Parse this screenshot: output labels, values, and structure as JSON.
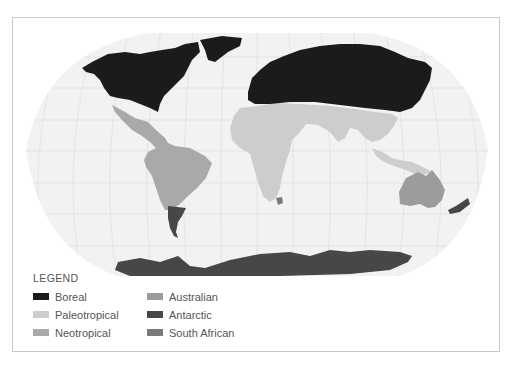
{
  "map": {
    "projection": "Robinson",
    "background_color": "#f2f2f2",
    "graticule_color": "#dedede",
    "regions": [
      {
        "name": "Boreal",
        "color": "#1b1b1b",
        "areas": [
          "North America (north of Mexico)",
          "Greenland",
          "Europe",
          "North Africa coast",
          "Northern Asia"
        ]
      },
      {
        "name": "Paleotropical",
        "color": "#cdcdcd",
        "areas": [
          "Africa",
          "Middle East",
          "South Asia",
          "Southeast Asia",
          "New Guinea"
        ]
      },
      {
        "name": "Neotropical",
        "color": "#a9a9a9",
        "areas": [
          "Mexico",
          "Central America",
          "South America"
        ]
      },
      {
        "name": "Australian",
        "color": "#9c9c9c",
        "areas": [
          "Australia"
        ]
      },
      {
        "name": "Antarctic",
        "color": "#474747",
        "areas": [
          "Antarctica",
          "Patagonia",
          "New Zealand"
        ]
      },
      {
        "name": "South African",
        "color": "#7a7a7a",
        "areas": [
          "Cape region"
        ]
      }
    ]
  },
  "legend": {
    "title": "LEGEND",
    "items": [
      {
        "label": "Boreal",
        "color": "#1b1b1b"
      },
      {
        "label": "Australian",
        "color": "#9c9c9c"
      },
      {
        "label": "Paleotropical",
        "color": "#cdcdcd"
      },
      {
        "label": "Antarctic",
        "color": "#474747"
      },
      {
        "label": "Neotropical",
        "color": "#a9a9a9"
      },
      {
        "label": "South African",
        "color": "#7a7a7a"
      }
    ]
  }
}
